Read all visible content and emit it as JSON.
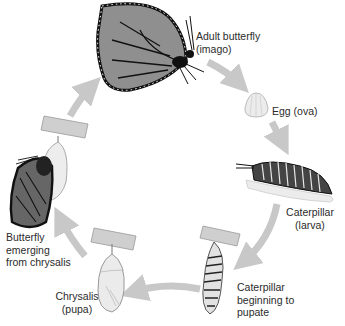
{
  "diagram": {
    "colors": {
      "arrow": "#c8c8c8",
      "text": "#2b2b2b",
      "wing_fill": "#8f8f8f",
      "wing_stroke": "#111111",
      "chrysalis": "#e6e6e6",
      "branch": "#bdbdbd"
    },
    "stages": [
      {
        "id": "adult",
        "label": "Adult butterfly\n(imago)",
        "icon": "butterfly-icon"
      },
      {
        "id": "egg",
        "label": "Egg (ova)",
        "icon": "egg-icon"
      },
      {
        "id": "larva",
        "label": "Caterpillar\n(larva)",
        "icon": "caterpillar-icon"
      },
      {
        "id": "prepupa",
        "label": "Caterpillar\nbeginning to\npupate",
        "icon": "hanging-caterpillar-icon"
      },
      {
        "id": "pupa",
        "label": "Chrysalis\n(pupa)",
        "icon": "chrysalis-icon"
      },
      {
        "id": "emerging",
        "label": "Butterfly\nemerging\nfrom chrysalis",
        "icon": "emerging-butterfly-icon"
      }
    ],
    "arrows": [
      {
        "from": "adult",
        "to": "egg"
      },
      {
        "from": "egg",
        "to": "larva"
      },
      {
        "from": "larva",
        "to": "prepupa"
      },
      {
        "from": "prepupa",
        "to": "pupa"
      },
      {
        "from": "pupa",
        "to": "emerging"
      },
      {
        "from": "emerging",
        "to": "adult"
      }
    ]
  }
}
